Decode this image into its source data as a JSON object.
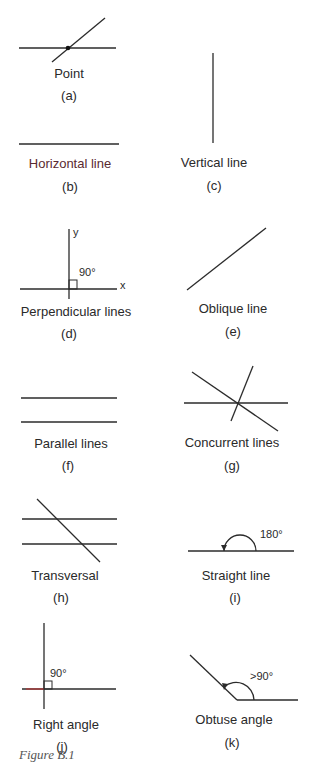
{
  "figure_caption": "Figure B.1",
  "panels": [
    {
      "id": "a",
      "name": "Point",
      "letter": "(a)"
    },
    {
      "id": "b",
      "name": "Horizontal line",
      "letter": "(b)"
    },
    {
      "id": "c",
      "name": "Vertical line",
      "letter": "(c)"
    },
    {
      "id": "d",
      "name": "Perpendicular lines",
      "letter": "(d)",
      "angle_label": "90°",
      "axis_x": "x",
      "axis_y": "y"
    },
    {
      "id": "e",
      "name": "Oblique line",
      "letter": "(e)"
    },
    {
      "id": "f",
      "name": "Parallel lines",
      "letter": "(f)"
    },
    {
      "id": "g",
      "name": "Concurrent lines",
      "letter": "(g)"
    },
    {
      "id": "h",
      "name": "Transversal",
      "letter": "(h)"
    },
    {
      "id": "i",
      "name": "Straight line",
      "letter": "(i)",
      "angle_label": "180°"
    },
    {
      "id": "j",
      "name": "Right angle",
      "letter": "(j)",
      "angle_label": "90°"
    },
    {
      "id": "k",
      "name": "Obtuse angle",
      "letter": "(k)",
      "angle_label": ">90°"
    }
  ]
}
